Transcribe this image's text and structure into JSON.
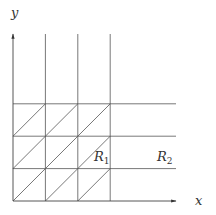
{
  "diagram": {
    "axes": {
      "x_label": "x",
      "y_label": "y"
    },
    "regions": [
      {
        "name": "R",
        "sub": "1"
      },
      {
        "name": "R",
        "sub": "2"
      }
    ],
    "grid": {
      "columns": 3,
      "rows": 3,
      "diagonals": "lower-left to upper-right in each cell"
    },
    "colors": {
      "line": "#555555",
      "text": "#333333"
    }
  }
}
